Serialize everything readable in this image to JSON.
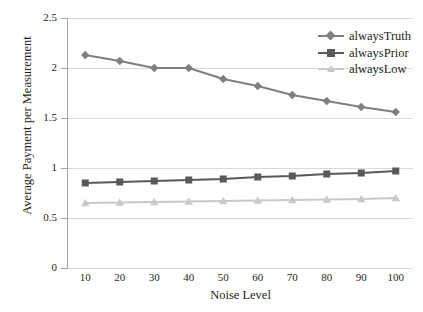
{
  "chart_data": {
    "type": "line",
    "title": "",
    "clipped_top_text": "",
    "xlabel": "Noise Level",
    "ylabel": "Average Payment per Measurement",
    "x": [
      10,
      20,
      30,
      40,
      50,
      60,
      70,
      80,
      90,
      100
    ],
    "xtick_labels": [
      "10",
      "20",
      "30",
      "40",
      "50",
      "60",
      "70",
      "80",
      "90",
      "100"
    ],
    "ytick_labels": [
      "0",
      "0.5",
      "1",
      "1.5",
      "2",
      "2.5"
    ],
    "yticks": [
      0,
      0.5,
      1,
      1.5,
      2,
      2.5
    ],
    "ylim": [
      0,
      2.5
    ],
    "grid": true,
    "legend_position": "top-right",
    "series": [
      {
        "name": "alwaysTruth",
        "color": "#7f7f7f",
        "marker": "diamond",
        "values": [
          2.13,
          2.07,
          2.0,
          2.0,
          1.89,
          1.82,
          1.73,
          1.67,
          1.61,
          1.56
        ]
      },
      {
        "name": "alwaysPrior",
        "color": "#595959",
        "marker": "square",
        "values": [
          0.85,
          0.86,
          0.87,
          0.88,
          0.89,
          0.91,
          0.92,
          0.94,
          0.95,
          0.97
        ]
      },
      {
        "name": "alwaysLow",
        "color": "#c9c9c9",
        "marker": "triangle",
        "values": [
          0.65,
          0.655,
          0.66,
          0.665,
          0.67,
          0.675,
          0.68,
          0.685,
          0.69,
          0.7
        ]
      }
    ]
  }
}
